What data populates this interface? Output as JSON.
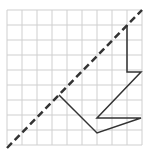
{
  "diagram": {
    "grid": {
      "origin_x": 7,
      "origin_y": 10,
      "cell": 15,
      "cols": 9,
      "rows": 9,
      "color": "#cfcfcf"
    },
    "line_of_reflection": {
      "style": "dashed",
      "color": "#333333",
      "from": [
        7,
        148
      ],
      "to": [
        142,
        10
      ]
    },
    "shape": {
      "color": "#333333",
      "points": [
        [
          127,
          25
        ],
        [
          127,
          72
        ],
        [
          141,
          72
        ],
        [
          97,
          118
        ],
        [
          141,
          118
        ],
        [
          97,
          133
        ],
        [
          59,
          95
        ]
      ]
    }
  }
}
